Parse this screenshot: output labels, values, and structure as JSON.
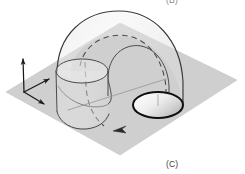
{
  "figure": {
    "panel_label": "(C)",
    "adjacent_panel_label_clipped": "(B)",
    "background_color": "#ffffff",
    "ground_plane": {
      "name": "ground-plane",
      "fill_color": "#cfcfcf",
      "points": "120,23 237,80 120,155 6,92"
    },
    "axes": {
      "name": "coordinate-axes",
      "color": "#1a1a1a",
      "origin": {
        "x": 24,
        "y": 92
      },
      "arrows": [
        {
          "name": "axis-z-up",
          "x2": 23,
          "y2": 58
        },
        {
          "name": "axis-y-right",
          "x2": 50,
          "y2": 79
        },
        {
          "name": "axis-x-front",
          "x2": 45,
          "y2": 105
        }
      ]
    },
    "elbow_tube": {
      "name": "elbow-tube",
      "outline_color": "#3a3a3a",
      "hidden_line_color": "#4a4a4a",
      "hidden_line_style": "dashed"
    },
    "cylinder": {
      "name": "vertical-cylinder",
      "outline_color": "#4a4a4a",
      "top_ellipse_center": {
        "x": 82,
        "y": 71
      },
      "top_ellipse_rx": 26,
      "top_ellipse_ry": 12
    },
    "exit_ellipse": {
      "name": "exit-face-ellipse",
      "stroke_color": "#101010",
      "stroke_width": 2,
      "fill_light": "#f4f4f4",
      "fill_dark": "#b9b9b9",
      "center": {
        "x": 158,
        "y": 105
      },
      "rx": 25,
      "ry": 13
    },
    "flow_arrow": {
      "name": "flow-direction-arrow",
      "color": "#2b2b2b",
      "direction": "left"
    },
    "centerline": {
      "name": "tube-centerline",
      "color": "#9a9a9a"
    }
  }
}
